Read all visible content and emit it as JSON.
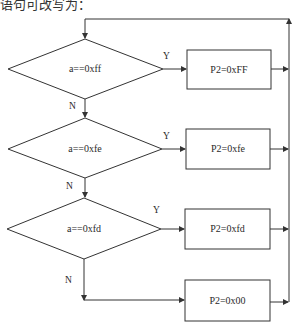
{
  "header_fragment": "语句可改写为：",
  "flowchart": {
    "decisions": [
      {
        "id": "d1",
        "label": "a==0xff",
        "yes": "Y",
        "no": "N"
      },
      {
        "id": "d2",
        "label": "a==0xfe",
        "yes": "Y",
        "no": "N"
      },
      {
        "id": "d3",
        "label": "a==0xfd",
        "yes": "Y",
        "no": "N"
      }
    ],
    "processes": [
      {
        "id": "p1",
        "label": "P2=0xFF"
      },
      {
        "id": "p2",
        "label": "P2=0xfe"
      },
      {
        "id": "p3",
        "label": "P2=0xfd"
      },
      {
        "id": "p4",
        "label": "P2=0x00"
      }
    ],
    "line_color": "#333333",
    "background": "#ffffff"
  }
}
